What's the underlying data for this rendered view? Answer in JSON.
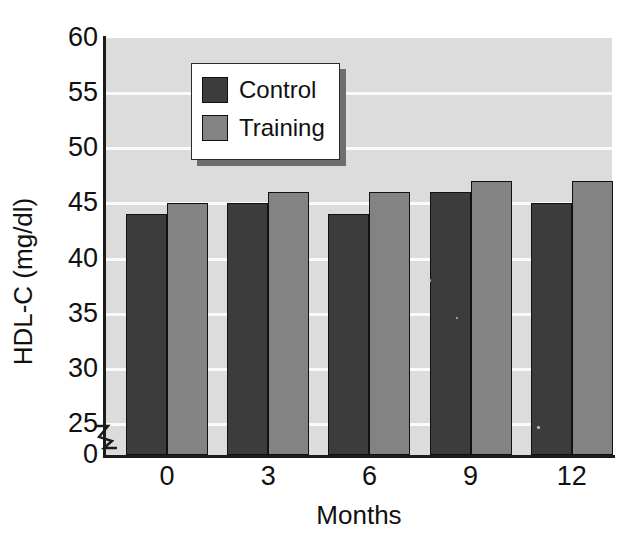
{
  "chart_data": {
    "type": "bar",
    "title": "",
    "subtitle": "",
    "xlabel": "Months",
    "ylabel": "HDL-C (mg/dl)",
    "categories": [
      "0",
      "3",
      "6",
      "9",
      "12"
    ],
    "series": [
      {
        "name": "Control",
        "color": "#3c3c3c",
        "values": [
          44,
          45,
          44,
          46,
          45
        ]
      },
      {
        "name": "Training",
        "color": "#838383",
        "values": [
          45,
          46,
          46,
          47,
          47
        ]
      }
    ],
    "ylim": [
      25,
      60
    ],
    "yticks": [
      "0",
      "25",
      "30",
      "35",
      "40",
      "45",
      "50",
      "55",
      "60"
    ],
    "ytick_values": [
      0,
      25,
      30,
      35,
      40,
      45,
      50,
      55,
      60
    ],
    "axis_break": true,
    "axis_break_between": [
      0,
      25
    ],
    "grid": true,
    "grid_orientation": "horizontal",
    "grid_color": "#fbfbfb",
    "plot_background": "#dcdcdc",
    "legend_position": "upper-left-inside",
    "legend_entries": [
      "Control",
      "Training"
    ],
    "units": "mg/dl"
  },
  "axes": {
    "y_title": "HDL-C (mg/dl)",
    "x_title": "Months"
  },
  "legend": {
    "items": [
      {
        "label": "Control"
      },
      {
        "label": "Training"
      }
    ]
  },
  "colors": {
    "control": "#3c3c3c",
    "training": "#838383",
    "plot_bg": "#dcdcdc",
    "grid": "#fbfbfb",
    "axis": "#1c1c1c",
    "page_bg": "#ffffff"
  }
}
